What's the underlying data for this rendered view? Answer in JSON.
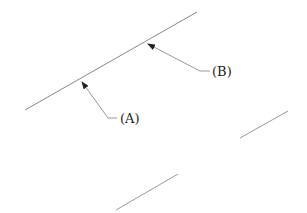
{
  "diagram": {
    "lines": [
      {
        "id": "main-line",
        "x1": 25,
        "y1": 110,
        "x2": 197,
        "y2": 12
      },
      {
        "id": "right-line",
        "x1": 240,
        "y1": 138,
        "x2": 288,
        "y2": 111
      },
      {
        "id": "bottom-line",
        "x1": 116,
        "y1": 210,
        "x2": 178,
        "y2": 174
      }
    ],
    "callouts": [
      {
        "id": "A",
        "label": "(A)",
        "tip": [
          81,
          80
        ],
        "elbow": [
          108,
          118
        ],
        "end": [
          117,
          118
        ],
        "text_pos": [
          120,
          123
        ]
      },
      {
        "id": "B",
        "label": "(B)",
        "tip": [
          146,
          43
        ],
        "elbow": [
          200,
          71
        ],
        "end": [
          210,
          71
        ],
        "text_pos": [
          212,
          76
        ]
      }
    ],
    "colors": {
      "line": "#888888",
      "leader": "#999999",
      "arrow": "#222222",
      "text": "#222222"
    }
  }
}
